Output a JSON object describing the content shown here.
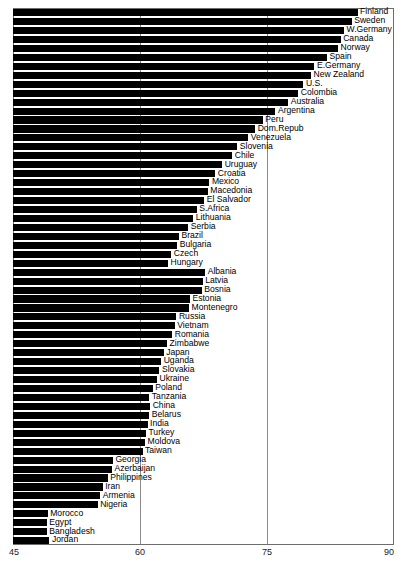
{
  "chart_data": {
    "type": "bar",
    "orientation": "horizontal",
    "title": "",
    "subtitle": "",
    "xlabel": "",
    "ylabel": "",
    "xlim": [
      45,
      90
    ],
    "ylim": null,
    "grid": true,
    "gridlines_x": [
      60,
      75
    ],
    "legend": null,
    "legend_position": "none",
    "bar_color": "#000000",
    "axis_color": "#6d6d6d",
    "xticks": [
      45,
      60,
      75,
      90
    ],
    "xtick_labels": [
      "45",
      "60",
      "75",
      "90"
    ],
    "categories": [
      "Finland",
      "Sweden",
      "W.Germany",
      "Canada",
      "Norway",
      "Spain",
      "E.Germany",
      "New Zealand",
      "U.S.",
      "Colombia",
      "Australia",
      "Argentina",
      "Peru",
      "Dom.Repub",
      "Venezuela",
      "Slovenia",
      "Chile",
      "Uruguay",
      "Croatia",
      "Mexico",
      "Macedonia",
      "El Salvador",
      "S.Africa",
      "Lithuania",
      "Serbia",
      "Brazil",
      "Bulgaria",
      "Czech",
      "Hungary",
      "Albania",
      "Latvia",
      "Bosnia",
      "Estonia",
      "Montenegro",
      "Russia",
      "Vietnam",
      "Romania",
      "Zimbabwe",
      "Japan",
      "Uganda",
      "Slovakia",
      "Ukraine",
      "Poland",
      "Tanzania",
      "China",
      "Belarus",
      "India",
      "Turkey",
      "Moldova",
      "Taiwan",
      "Georgia",
      "Azerbaijan",
      "Philippines",
      "Iran",
      "Armenia",
      "Nigeria",
      "Morocco",
      "Egypt",
      "Bangladesh",
      "Jordan"
    ],
    "values": [
      85.7,
      85.0,
      84.1,
      83.7,
      83.4,
      82.1,
      80.6,
      80.2,
      79.3,
      78.7,
      77.5,
      76.0,
      74.5,
      73.6,
      72.8,
      71.5,
      70.9,
      69.7,
      68.9,
      68.2,
      68.0,
      67.6,
      66.7,
      66.3,
      65.7,
      64.6,
      64.4,
      63.7,
      63.3,
      67.7,
      67.4,
      67.3,
      65.9,
      65.8,
      64.3,
      64.1,
      63.8,
      63.2,
      62.8,
      62.5,
      62.3,
      62.0,
      61.5,
      61.1,
      61.2,
      61.1,
      60.9,
      60.7,
      60.6,
      60.3,
      56.8,
      56.7,
      56.2,
      55.6,
      55.3,
      55.0,
      49.1,
      49.0,
      49.0,
      49.3
    ]
  }
}
